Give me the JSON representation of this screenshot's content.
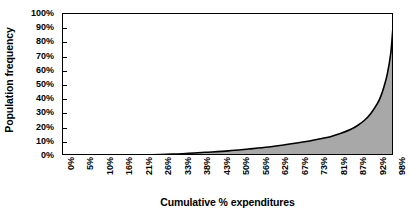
{
  "chart_data": {
    "type": "area",
    "title": "",
    "xlabel": "Cumulative % expenditures",
    "ylabel": "Population frequency",
    "grid": false,
    "legend": false,
    "xlim": [
      0,
      100
    ],
    "ylim": [
      0,
      100
    ],
    "y_tick_labels": [
      "100%",
      "90%",
      "80%",
      "70%",
      "60%",
      "50%",
      "40%",
      "30%",
      "20%",
      "10%",
      "0%"
    ],
    "y_tick_values": [
      100,
      90,
      80,
      70,
      60,
      50,
      40,
      30,
      20,
      10,
      0
    ],
    "categories": [
      "0%",
      "5%",
      "10%",
      "16%",
      "21%",
      "26%",
      "33%",
      "38%",
      "43%",
      "50%",
      "56%",
      "62%",
      "67%",
      "73%",
      "81%",
      "87%",
      "92%",
      "98%"
    ],
    "x": [
      0,
      5,
      10,
      16,
      21,
      26,
      33,
      38,
      43,
      50,
      56,
      62,
      67,
      73,
      81,
      87,
      92,
      98
    ],
    "values": [
      0,
      0,
      0,
      0.3,
      0.5,
      0.8,
      1.2,
      1.8,
      2.5,
      3.5,
      4.8,
      6.2,
      7.8,
      9.8,
      13.5,
      18.5,
      27,
      55
    ],
    "series": [
      {
        "name": "Cumulative expenditure distribution",
        "values": [
          0,
          0,
          0,
          0.3,
          0.5,
          0.8,
          1.2,
          1.8,
          2.5,
          3.5,
          4.8,
          6.2,
          7.8,
          9.8,
          13.5,
          18.5,
          27,
          55
        ],
        "fill_color": "#a8a8a8",
        "line_color": "#000000"
      }
    ],
    "curve_points": [
      [
        0,
        0
      ],
      [
        5,
        0
      ],
      [
        10,
        0.1
      ],
      [
        16,
        0.3
      ],
      [
        21,
        0.5
      ],
      [
        26,
        0.8
      ],
      [
        33,
        1.3
      ],
      [
        38,
        1.9
      ],
      [
        43,
        2.6
      ],
      [
        50,
        3.6
      ],
      [
        56,
        4.9
      ],
      [
        62,
        6.3
      ],
      [
        67,
        7.9
      ],
      [
        73,
        10.0
      ],
      [
        77,
        11.8
      ],
      [
        81,
        13.8
      ],
      [
        84,
        16.0
      ],
      [
        87,
        18.8
      ],
      [
        89,
        21.5
      ],
      [
        91,
        25.0
      ],
      [
        93,
        30.0
      ],
      [
        95,
        37.0
      ],
      [
        96,
        42.0
      ],
      [
        97,
        49.0
      ],
      [
        98,
        58.0
      ],
      [
        99,
        72.0
      ],
      [
        99.5,
        85.0
      ],
      [
        100,
        100
      ]
    ],
    "colors": {
      "fill": "#a8a8a8",
      "line": "#000000",
      "axis": "#000000",
      "background": "#ffffff",
      "text": "#000000"
    }
  }
}
